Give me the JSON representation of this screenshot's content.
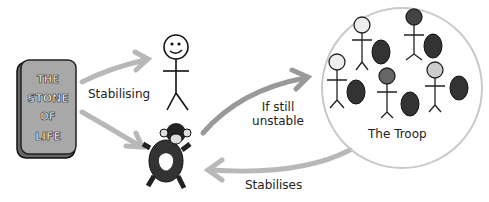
{
  "stone": {
    "lines": [
      "THE",
      "STONE",
      "OF",
      "LIFE"
    ]
  },
  "labels": {
    "stabilising": "Stabilising",
    "if_still_line1": "If still",
    "if_still_line2": "unstable",
    "troop": "The Troop",
    "stabilises": "Stabilises"
  },
  "colors": {
    "arrow": "#b8b8b8",
    "stone": "#9a9a9a",
    "ink": "#111111"
  }
}
